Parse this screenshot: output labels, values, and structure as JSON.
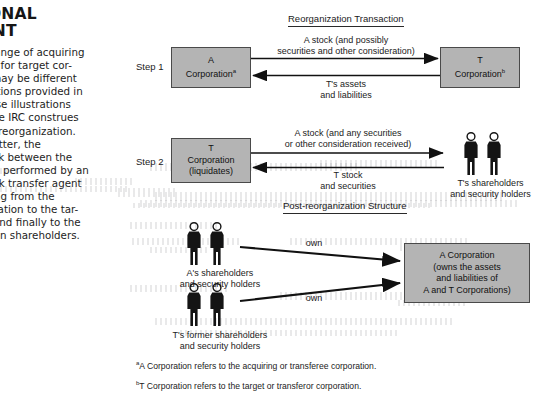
{
  "left_column": {
    "chapter_title": "IONAL\nENT",
    "body_text": "exchange of acquiring\n stock for target cor-\nock may be different\nustrations provided in\n. These illustrations\now the IRC construes\n each reorganization.\nal matter, the\nf stock between the\nally is performed by an\nt stock transfer agent\n flowing from the\norporation to the tar-\ntion and finally to the\noration shareholders."
  },
  "diagram": {
    "section_headings": {
      "reorganization": "Reorganization Transaction",
      "post_reorganization": "Post-reorganization Structure"
    },
    "step1": {
      "label": "Step 1",
      "left_box": {
        "line1": "A",
        "line2": "Corporation",
        "superscript": "a"
      },
      "right_box": {
        "line1": "T",
        "line2": "Corporation",
        "superscript": "b"
      },
      "arrow_top_label": "A stock (and possibly\nsecurities and other consideration)",
      "arrow_bottom_label": "T's assets\nand liabilities"
    },
    "step2": {
      "label": "Step 2",
      "left_box": {
        "line1": "T",
        "line2": "Corporation",
        "line3": "(liquidates)"
      },
      "arrow_top_label": "A stock (and any securities\nor other consideration received)",
      "arrow_bottom_label": "T stock\nand securities",
      "right_actor_label": "T's shareholders\nand security holders"
    },
    "post_reorg": {
      "actor_top_label": "A's shareholders\nand security holders",
      "actor_bottom_label": "T's former shareholders\nand security holders",
      "own_label_top": "own",
      "own_label_bottom": "own",
      "corp_box": "A Corporation\n(owns the assets\nand liabilities of\nA and T Corporations)"
    },
    "footnotes": [
      {
        "marker": "a",
        "text": "A Corporation refers to the acquiring or transferee corporation."
      },
      {
        "marker": "b",
        "text": "T Corporation refers to the target or transferor corporation."
      }
    ],
    "colors": {
      "box_fill": "#b4b4b4",
      "box_border": "#4a4a4a",
      "ink": "#1b1b1b",
      "page": "#ffffff"
    },
    "icons": {
      "person": "person-silhouette-icon",
      "arrow": "arrow-right-icon"
    }
  }
}
